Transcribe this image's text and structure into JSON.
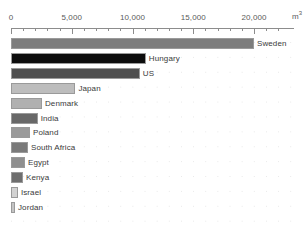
{
  "chart_data": {
    "type": "bar",
    "title": "",
    "subtitle": "",
    "xlabel": "",
    "ylabel": "",
    "unit_label": "m",
    "unit_exponent": "3",
    "orientation": "horizontal",
    "grid": true,
    "legend": "none",
    "xlim": [
      0,
      22500
    ],
    "xticks": [
      0,
      5000,
      10000,
      15000,
      20000
    ],
    "xtick_labels": [
      "0",
      "5,000",
      "10,000",
      "15,000",
      "20,000"
    ],
    "minor_tick_step": 1000,
    "categories": [
      "Sweden",
      "Hungary",
      "US",
      "Japan",
      "Denmark",
      "India",
      "Poland",
      "South Africa",
      "Egypt",
      "Kenya",
      "Israel",
      "Jordan"
    ],
    "values": [
      20000,
      11100,
      10600,
      5300,
      2550,
      2200,
      1560,
      1400,
      1150,
      990,
      570,
      330
    ],
    "bar_colors": [
      "#7d7d7d",
      "#0d0d0d",
      "#4f4f4f",
      "#bdbdbd",
      "#b0b0b0",
      "#686868",
      "#9a9a9a",
      "#7a7a7a",
      "#8f8f8f",
      "#6e6e6e",
      "#d2d2d2",
      "#c4c4c4"
    ]
  }
}
